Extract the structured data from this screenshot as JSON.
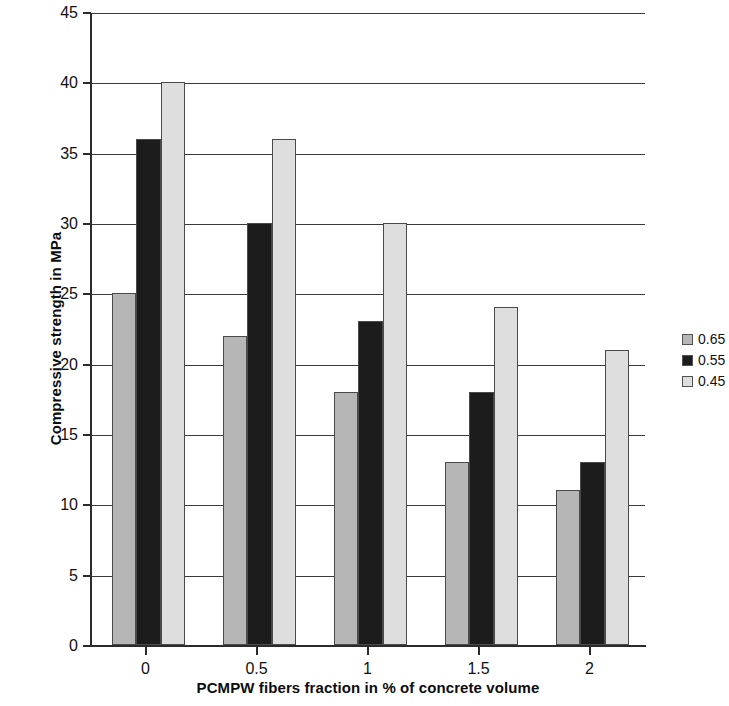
{
  "chart_data": {
    "type": "bar",
    "title": "",
    "xlabel": "PCMPW fibers fraction in % of concrete volume",
    "ylabel": "Compressive strength in MPa",
    "categories": [
      "0",
      "0.5",
      "1",
      "1.5",
      "2"
    ],
    "series": [
      {
        "name": "0.65",
        "color": "#b6b6b6",
        "values": [
          25,
          22,
          18,
          13,
          11
        ]
      },
      {
        "name": "0.55",
        "color": "#1c1c1c",
        "values": [
          36,
          30,
          23,
          18,
          13
        ]
      },
      {
        "name": "0.45",
        "color": "#dedede",
        "values": [
          40,
          36,
          30,
          24,
          21
        ]
      }
    ],
    "ylim": [
      0,
      45
    ],
    "ytick_values": [
      0,
      5,
      10,
      15,
      20,
      25,
      30,
      35,
      40,
      45
    ],
    "ytick_labels": [
      "0",
      "5",
      "10",
      "15",
      "20",
      "25",
      "30",
      "35",
      "40",
      "45"
    ],
    "grid": "horizontal",
    "legend_position": "right",
    "bar_border_color": "#4a4a4a",
    "axis_color": "#2b2b2b"
  }
}
